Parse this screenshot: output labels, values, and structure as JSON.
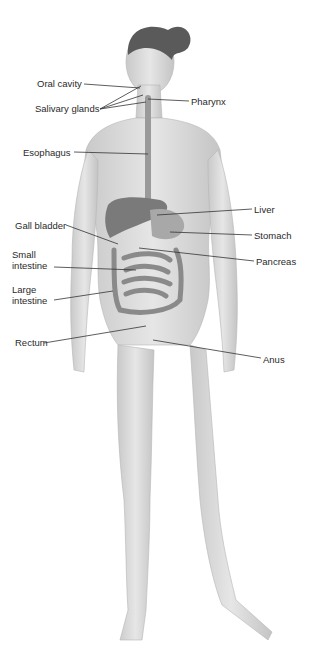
{
  "diagram": {
    "labels_left": [
      {
        "id": "oral-cavity",
        "text": "Oral cavity",
        "x": 37,
        "y": 78
      },
      {
        "id": "salivary-glands",
        "text": "Salivary glands",
        "x": 35,
        "y": 103
      },
      {
        "id": "esophagus",
        "text": "Esophagus",
        "x": 23,
        "y": 147
      },
      {
        "id": "gall-bladder",
        "text": "Gall bladder",
        "x": 15,
        "y": 221
      },
      {
        "id": "small-intestine",
        "text": "Small\nintestine",
        "line1": "Small",
        "line2": "intestine",
        "x": 12,
        "y": 247
      },
      {
        "id": "large-intestine",
        "text": "Large\nintestine",
        "line1": "Large",
        "line2": "intestine",
        "x": 12,
        "y": 284
      },
      {
        "id": "rectum",
        "text": "Rectum",
        "x": 15,
        "y": 337
      }
    ],
    "labels_right": [
      {
        "id": "pharynx",
        "text": "Pharynx",
        "x": 191,
        "y": 96
      },
      {
        "id": "liver",
        "text": "Liver",
        "x": 254,
        "y": 205
      },
      {
        "id": "stomach",
        "text": "Stomach",
        "x": 254,
        "y": 231
      },
      {
        "id": "pancreas",
        "text": "Pancreas",
        "x": 256,
        "y": 257
      },
      {
        "id": "anus",
        "text": "Anus",
        "x": 263,
        "y": 354
      }
    ],
    "colors": {
      "skin": "#d9d9d9",
      "organs": "#8a8a8a",
      "liver": "#7a7a7a",
      "hair": "#5a5a5a",
      "leader_line": "#333333",
      "label_text": "#2a2a2a"
    }
  }
}
